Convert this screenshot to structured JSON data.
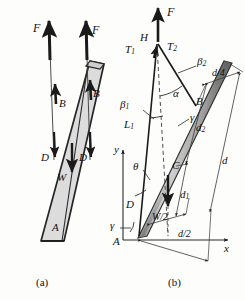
{
  "figure": {
    "panels": [
      {
        "id": "a",
        "caption": "(a)",
        "description": "free-body sketch of inclined plate with buoyancy and weight forces"
      },
      {
        "id": "b",
        "caption": "(b)",
        "description": "geometric layout with angles and dimensions"
      }
    ]
  },
  "panel_a": {
    "caption": "(a)",
    "forces": [
      {
        "name": "F-left",
        "label": "F"
      },
      {
        "name": "F-right",
        "label": "F"
      },
      {
        "name": "B-left",
        "label": "B"
      },
      {
        "name": "B-right",
        "label": "B"
      },
      {
        "name": "D-left",
        "label": "D"
      },
      {
        "name": "D-right",
        "label": "D"
      },
      {
        "name": "W",
        "label": "W"
      }
    ],
    "point_A": "A"
  },
  "panel_b": {
    "caption": "(b)",
    "forces": [
      {
        "name": "F",
        "label": "F"
      },
      {
        "name": "H",
        "label": "H"
      },
      {
        "name": "T1",
        "label": "T",
        "sub": "1"
      },
      {
        "name": "T2",
        "label": "T",
        "sub": "2"
      }
    ],
    "angles": [
      {
        "name": "alpha",
        "label": "α"
      },
      {
        "name": "beta1",
        "label": "β",
        "sub": "1"
      },
      {
        "name": "beta2",
        "label": "β",
        "sub": "2"
      },
      {
        "name": "gamma-upper",
        "label": "γ"
      },
      {
        "name": "gamma-lower",
        "label": "γ"
      },
      {
        "name": "theta",
        "label": "θ"
      }
    ],
    "points": [
      {
        "name": "point-A",
        "label": "A"
      },
      {
        "name": "point-B",
        "label": "B"
      },
      {
        "name": "point-C",
        "label": "C"
      },
      {
        "name": "point-D",
        "label": "D"
      }
    ],
    "lengths": [
      {
        "name": "L1",
        "label": "L",
        "sub": "1"
      },
      {
        "name": "d",
        "label": "d"
      },
      {
        "name": "d1",
        "label": "d",
        "sub": "1"
      },
      {
        "name": "d2",
        "label": "d",
        "sub": "2"
      },
      {
        "name": "d-over-4",
        "label": "d/4"
      },
      {
        "name": "d-over-2",
        "label": "d/2"
      },
      {
        "name": "W-over-2",
        "label": "W/2"
      }
    ],
    "axes": [
      {
        "name": "y-axis",
        "label": "y"
      },
      {
        "name": "x-axis",
        "label": "x"
      }
    ]
  },
  "colors": {
    "plate_fill": "#dcdcdc",
    "plate_edge": "#262626",
    "bar_light": "#c9c9c9",
    "bar_dark": "#6e6e6e",
    "arrow": "#1a1a1a",
    "thin_line": "#3a3a3a",
    "background": "#fdfdfb"
  }
}
